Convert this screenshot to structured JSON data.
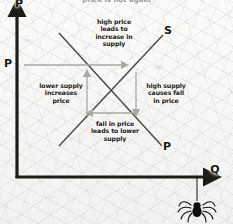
{
  "diagram": {
    "title_partial": "price is not again",
    "type": "cobweb-supply-price-diagram",
    "axes": {
      "y_axis_label": "P",
      "x_axis_label": "Q",
      "price_level_label": "P",
      "axis_color": "#1d1d18"
    },
    "curves": [
      {
        "name": "supply-curve",
        "label": "S",
        "direction": "upward-sloping",
        "color": "#4c4c44"
      },
      {
        "name": "price-curve",
        "label": "P",
        "direction": "downward-sloping",
        "color": "#4c4c44"
      }
    ],
    "annotations": [
      {
        "name": "annotation-high-price",
        "text": "high price\nleads to\nincrease in\nsupply"
      },
      {
        "name": "annotation-lower-supply",
        "text": "lower supply\nincreases\nprice"
      },
      {
        "name": "annotation-high-supply",
        "text": "high supply\ncauses fall\nin price"
      },
      {
        "name": "annotation-fall-in-price",
        "text": "fall in price\nleads to lower\nsupply"
      }
    ],
    "arrows": [
      {
        "name": "arrow-right-top",
        "direction": "right",
        "color": "#a9a9a2"
      },
      {
        "name": "arrow-up-left",
        "direction": "up",
        "color": "#a9a9a2"
      },
      {
        "name": "arrow-down-right",
        "direction": "down",
        "color": "#a9a9a2"
      },
      {
        "name": "arrow-left-bottom",
        "direction": "left",
        "color": "#a9a9a2"
      }
    ],
    "decoration": {
      "name": "spider",
      "description": "spider hanging on thread below Q axis",
      "color": "#101010"
    }
  }
}
